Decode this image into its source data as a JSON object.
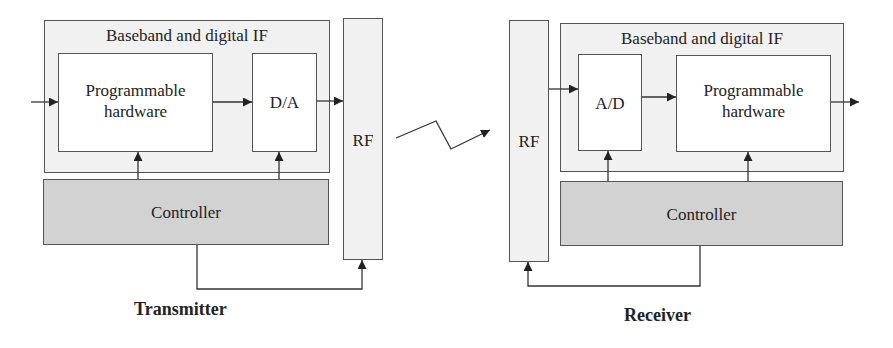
{
  "transmitter": {
    "caption": "Transmitter",
    "baseband_title": "Baseband and digital IF",
    "programmable_line1": "Programmable",
    "programmable_line2": "hardware",
    "converter": "D/A",
    "controller": "Controller",
    "rf": "RF"
  },
  "receiver": {
    "caption": "Receiver",
    "baseband_title": "Baseband and digital IF",
    "programmable_line1": "Programmable",
    "programmable_line2": "hardware",
    "converter": "A/D",
    "controller": "Controller",
    "rf": "RF"
  },
  "colors": {
    "baseband_fill": "#f1f1f1",
    "controller_fill": "#d2d2d2",
    "block_fill": "#ffffff",
    "stroke": "#555555"
  }
}
